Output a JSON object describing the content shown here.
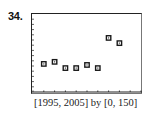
{
  "problem": {
    "number": "34."
  },
  "window_label": "[1995, 2005] by [0, 150]",
  "chart_data": {
    "type": "scatter",
    "title": "",
    "xlabel": "",
    "ylabel": "",
    "xlim": [
      1995,
      2005
    ],
    "ylim": [
      0,
      150
    ],
    "x_tick_step": 1,
    "y_tick_step": 10,
    "grid": false,
    "legend": null,
    "marker": "square",
    "x": [
      1996,
      1997,
      1998,
      1999,
      2000,
      2001,
      2002,
      2003
    ],
    "y": [
      54,
      58,
      46,
      46,
      52,
      46,
      104,
      94
    ],
    "window_caption": "[1995, 2005] by [0, 150]"
  }
}
